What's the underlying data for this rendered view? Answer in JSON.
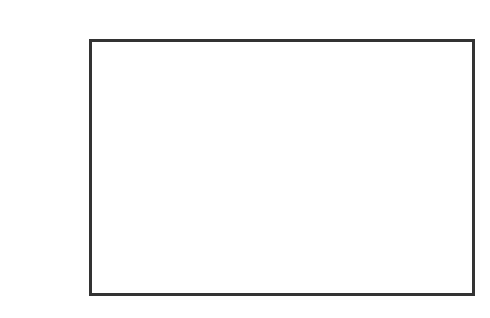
{
  "label": "(C)",
  "chart_data": {
    "type": "slope_field",
    "xlabel": "",
    "ylabel": "",
    "grid": false,
    "axes": {
      "x_axis_y_px": 164,
      "y_axis_x_px": 277
    },
    "columns": 10,
    "rows": 9,
    "column_slopes": [
      0.3,
      0.35,
      0.45,
      0.7,
      2.2,
      2.2,
      0.7,
      0.45,
      0.35,
      0.3
    ],
    "color": "#333333"
  }
}
